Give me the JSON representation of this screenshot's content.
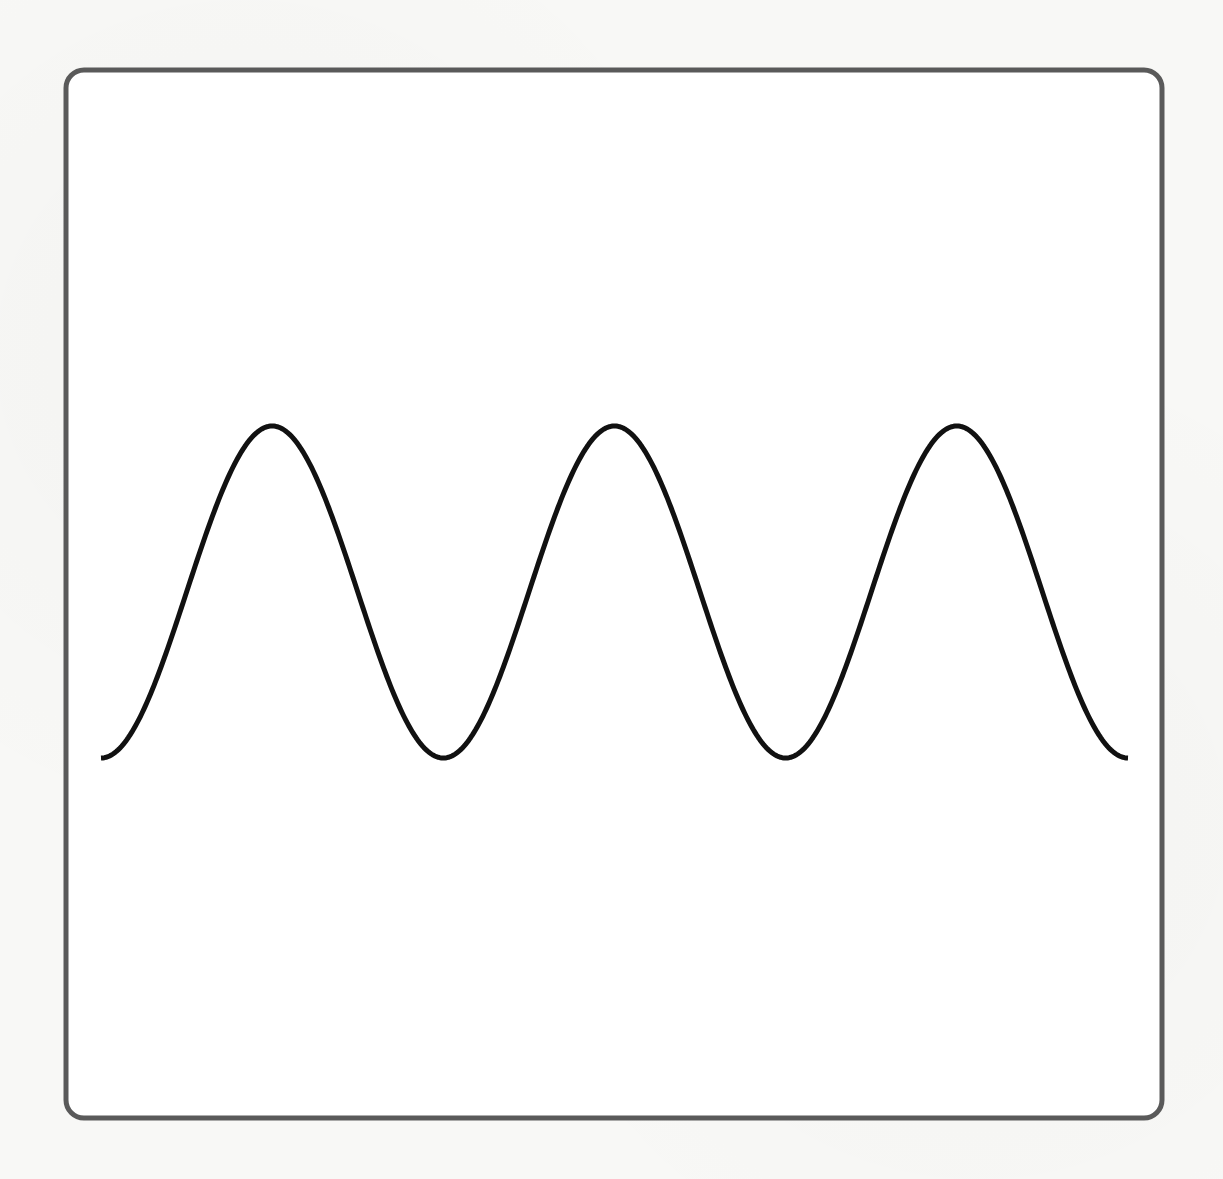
{
  "figure": {
    "frame": {
      "x": 66,
      "y": 70,
      "width": 1096,
      "height": 1048,
      "corner_radius": 18,
      "stroke_color": "#5a5a5a",
      "stroke_width": 5,
      "fill": "#ffffff"
    },
    "wave": {
      "type": "sine",
      "periods": 3,
      "x_start": 101,
      "x_end": 1128,
      "center_y": 592,
      "amplitude": 166,
      "phase": "starts and ends at trough",
      "stroke_color": "#111111",
      "stroke_width": 5,
      "peaks_x": [
        268,
        597,
        940
      ],
      "troughs_x": [
        427,
        787
      ]
    }
  }
}
